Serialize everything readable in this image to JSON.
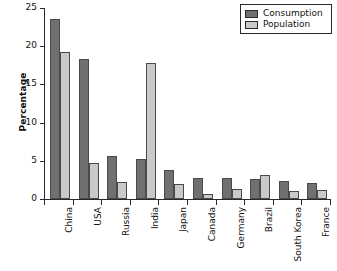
{
  "chart_data": {
    "type": "bar",
    "title": "",
    "xlabel": "",
    "ylabel": "Percentage",
    "ylim": [
      0,
      25
    ],
    "yticks": [
      0,
      5,
      10,
      15,
      20,
      25
    ],
    "grid": false,
    "legend_position": "top-right",
    "categories": [
      "China",
      "USA",
      "Russia",
      "India",
      "Japan",
      "Canada",
      "Germany",
      "Brazil",
      "South Korea",
      "France"
    ],
    "series": [
      {
        "name": "Consumption",
        "color": "#707070",
        "values": [
          23.6,
          18.3,
          5.6,
          5.2,
          3.8,
          2.8,
          2.7,
          2.6,
          2.4,
          2.1
        ]
      },
      {
        "name": "Population",
        "color": "#c9c9c9",
        "values": [
          19.3,
          4.7,
          2.2,
          17.8,
          1.9,
          0.6,
          1.3,
          3.1,
          1.0,
          1.2
        ]
      }
    ]
  },
  "legend": {
    "items": [
      {
        "label": "Consumption",
        "color": "#707070"
      },
      {
        "label": "Population",
        "color": "#c9c9c9"
      }
    ]
  },
  "axes": {
    "y_label": "Percentage",
    "y_tick_labels": [
      "0",
      "5",
      "10",
      "15",
      "20",
      "25"
    ]
  },
  "colors": {
    "consumption": "#707070",
    "population": "#c9c9c9",
    "axis": "#2a2a2a",
    "bar_outline": "#4a4a4a",
    "background": "#ffffff"
  }
}
